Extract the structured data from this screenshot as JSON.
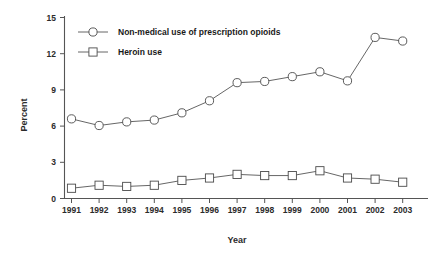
{
  "chart_data": {
    "type": "line",
    "title": "",
    "xlabel": "Year",
    "ylabel": "Percent",
    "categories": [
      "1991",
      "1992",
      "1993",
      "1994",
      "1995",
      "1996",
      "1997",
      "1998",
      "1999",
      "2000",
      "2001",
      "2002",
      "2003"
    ],
    "x": [
      1991,
      1992,
      1993,
      1994,
      1995,
      1996,
      1997,
      1998,
      1999,
      2000,
      2001,
      2002,
      2003
    ],
    "series": [
      {
        "name": "Non-medical use of prescription opioids",
        "marker": "circle",
        "values": [
          6.6,
          6.05,
          6.35,
          6.5,
          7.1,
          8.1,
          9.6,
          9.7,
          10.1,
          10.5,
          9.75,
          13.35,
          13.05
        ]
      },
      {
        "name": "Heroin use",
        "marker": "square",
        "values": [
          0.85,
          1.1,
          1.0,
          1.1,
          1.5,
          1.7,
          2.0,
          1.9,
          1.9,
          2.3,
          1.7,
          1.6,
          1.35
        ]
      }
    ],
    "ylim": [
      0,
      15
    ],
    "yticks": [
      0,
      3,
      6,
      9,
      12,
      15
    ],
    "ytick_labels": [
      "0",
      "3",
      "6",
      "9",
      "12",
      "15"
    ],
    "xlim": [
      1990.5,
      2003.5
    ],
    "grid": false,
    "legend_position": "top-left-inside",
    "colors": {
      "line": "#555555",
      "marker_fill": "#ffffff",
      "marker_stroke": "#4a4a4a",
      "axis": "#555555",
      "text": "#1a1a1a",
      "background": "#ffffff"
    }
  },
  "legend": {
    "entries": [
      {
        "label": "Non-medical use of prescription opioids",
        "marker": "circle"
      },
      {
        "label": "Heroin use",
        "marker": "square"
      }
    ]
  },
  "axes": {
    "y_title": "Percent",
    "x_title": "Year",
    "y_tick_0": "0",
    "y_tick_1": "3",
    "y_tick_2": "6",
    "y_tick_3": "9",
    "y_tick_4": "12",
    "y_tick_5": "15",
    "x_tick_0": "1991",
    "x_tick_1": "1992",
    "x_tick_2": "1993",
    "x_tick_3": "1994",
    "x_tick_4": "1995",
    "x_tick_5": "1996",
    "x_tick_6": "1997",
    "x_tick_7": "1998",
    "x_tick_8": "1999",
    "x_tick_9": "2000",
    "x_tick_10": "2001",
    "x_tick_11": "2002",
    "x_tick_12": "2003"
  }
}
